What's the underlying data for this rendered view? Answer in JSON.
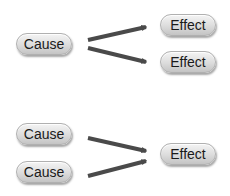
{
  "diagram": {
    "type": "cause-effect",
    "colors": {
      "arrow": "#4a4a4a",
      "pill_light": "#f4f4f4",
      "pill_dark": "#c4c4c4",
      "text": "#1a1a1a"
    },
    "top_group": {
      "description": "One cause leading to two effects",
      "causes": [
        {
          "label": "Cause"
        }
      ],
      "effects": [
        {
          "label": "Effect"
        },
        {
          "label": "Effect"
        }
      ]
    },
    "bottom_group": {
      "description": "Two causes leading to one effect",
      "causes": [
        {
          "label": "Cause"
        },
        {
          "label": "Cause"
        }
      ],
      "effects": [
        {
          "label": "Effect"
        }
      ]
    }
  }
}
